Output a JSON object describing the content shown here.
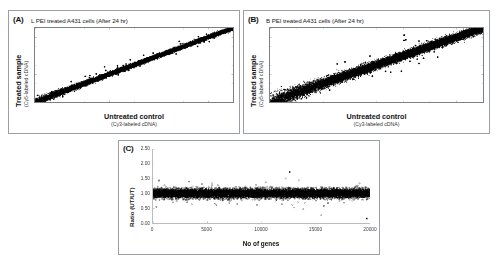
{
  "figure": {
    "panels": [
      {
        "tag": "(A)",
        "title": "L PEI treated A431 cells (After 24 hr)",
        "xlabel": "Untreated control",
        "xlabel_sub": "(Cy3-labeled cDNA)",
        "ylabel": "Treated sample",
        "ylabel_sub": "(Cy5-labeled cDNA)"
      },
      {
        "tag": "(B)",
        "title": "B PEI treated A431 cells (After 24 hr)",
        "xlabel": "Untreated control",
        "xlabel_sub": "(Cy3-labeled cDNA)",
        "ylabel": "Treated sample",
        "ylabel_sub": "(Cy5-labeled cDNA)"
      },
      {
        "tag": "(C)",
        "title": "",
        "xlabel": "No of genes",
        "ylabel": "Ratio (UT/UT)"
      }
    ]
  },
  "chart_data": [
    {
      "type": "scatter",
      "panel": "A",
      "title": "L PEI treated A431 cells (After 24 hr)",
      "xlabel": "Untreated control (Cy3-labeled cDNA)",
      "ylabel": "Treated sample (Cy5-labeled cDNA)",
      "xlim": [
        0,
        16
      ],
      "ylim": [
        0,
        16
      ],
      "xticks": [
        0,
        2,
        4,
        6,
        8,
        10,
        12,
        14,
        16
      ],
      "yticks": [
        0,
        2,
        4,
        6,
        8,
        10,
        12,
        14,
        16
      ],
      "grid": false,
      "n_points": 20000,
      "description": "Tight linear scatter band along the y=x diagonal indicating high correlation between L PEI treated and untreated samples",
      "correlation": 0.98,
      "band_halfwidth": 0.45,
      "seed": 1741
    },
    {
      "type": "scatter",
      "panel": "B",
      "title": "B PEI treated A431 cells (After 24 hr)",
      "xlabel": "Untreated control (Cy3-labeled cDNA)",
      "ylabel": "Treated sample (Cy5-labeled cDNA)",
      "xlim": [
        0,
        16
      ],
      "ylim": [
        0,
        16
      ],
      "xticks": [
        0,
        2,
        4,
        6,
        8,
        10,
        12,
        14,
        16
      ],
      "yticks": [
        0,
        2,
        4,
        6,
        8,
        10,
        12,
        14,
        16
      ],
      "grid": false,
      "n_points": 20000,
      "description": "Broader, more dispersed scatter band along the diagonal indicating more variation for B PEI treated samples",
      "correlation": 0.93,
      "band_halfwidth": 0.95,
      "seed": 9203
    },
    {
      "type": "scatter",
      "panel": "C",
      "title": "",
      "xlabel": "No of genes",
      "ylabel": "Ratio (UT/UT)",
      "xlim": [
        0,
        20000
      ],
      "ylim": [
        0,
        2.5
      ],
      "xticks": [
        0,
        5000,
        10000,
        15000,
        20000
      ],
      "xtick_labels": [
        "0",
        "5000",
        "10000",
        "15000",
        "20000"
      ],
      "yticks": [
        0.0,
        0.5,
        1.0,
        1.5,
        2.0,
        2.5
      ],
      "ytick_labels": [
        "0.00",
        "0.50",
        "1.00",
        "1.50",
        "2.00",
        "2.50"
      ],
      "grid": false,
      "n_points": 20000,
      "description": "Dense horizontal band of ratio values centered at 1.00 spanning the full gene index range, with sparse outliers up to about 1.6 and down to about 0.35",
      "center": 1.0,
      "spread": 0.17,
      "seed": 4457
    }
  ]
}
